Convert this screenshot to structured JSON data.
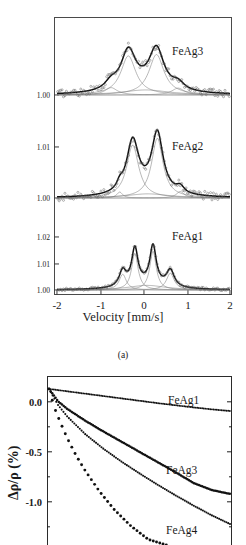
{
  "figure": {
    "subcaption_a": "(a)"
  },
  "mossbauer": {
    "ylabel": "Relative Emission",
    "xlabel": "Velocity [mm/s]",
    "xticks": [
      "-2",
      "-1",
      "0",
      "1",
      "2"
    ],
    "panels": [
      {
        "sample": "FeAg3",
        "yticks": [
          "1.00"
        ]
      },
      {
        "sample": "FeAg2",
        "yticks": [
          "1.01",
          "1.00"
        ]
      },
      {
        "sample": "FeAg1",
        "yticks": [
          "1.02",
          "1.01",
          "1.00"
        ]
      }
    ]
  },
  "magnetoresistance": {
    "ylabel": "Δρ/ρ (%)",
    "yticks": [
      "0.0",
      "-0.5",
      "-1.0"
    ],
    "curves": [
      "FeAg1",
      "FeAg3",
      "FeAg4"
    ]
  },
  "chart_data": [
    {
      "type": "line",
      "title": "Mossbauer spectra",
      "subcaption": "(a)",
      "xlabel": "Velocity [mm/s]",
      "ylabel": "Relative Emission",
      "xlim": [
        -2,
        2
      ],
      "xticks": [
        -2,
        -1,
        0,
        1,
        2
      ],
      "grid": false,
      "legend_position": "inside-right",
      "subplots": [
        {
          "name": "FeAg3",
          "ylim": [
            0.9985,
            1.0135
          ],
          "yticks": [
            1.0
          ],
          "ytick_labels": [
            "1.00"
          ],
          "baseline": 1.0,
          "markers": "open circles (experimental data)",
          "envelope": "thick black fitted curve",
          "components": [
            {
              "center": -0.35,
              "amplitude": 0.0085,
              "width": 0.42,
              "role": "main-doublet-left"
            },
            {
              "center": 0.3,
              "amplitude": 0.0088,
              "width": 0.42,
              "role": "main-doublet-right"
            },
            {
              "center": -0.75,
              "amplitude": 0.0016,
              "width": 0.35,
              "role": "minor-left"
            },
            {
              "center": 0.8,
              "amplitude": 0.0015,
              "width": 0.35,
              "role": "minor-right"
            },
            {
              "center": 0.05,
              "amplitude": 0.0011,
              "width": 1.3,
              "role": "broad-background"
            }
          ]
        },
        {
          "name": "FeAg2",
          "ylim": [
            0.9985,
            1.0185
          ],
          "yticks": [
            1.01,
            1.0
          ],
          "ytick_labels": [
            "1.01",
            "1.00"
          ],
          "baseline": 1.0,
          "markers": "open circles (experimental data)",
          "envelope": "thick black fitted curve",
          "components": [
            {
              "center": -0.25,
              "amplitude": 0.0115,
              "width": 0.34,
              "role": "main-doublet-left"
            },
            {
              "center": 0.32,
              "amplitude": 0.013,
              "width": 0.32,
              "role": "main-doublet-right"
            },
            {
              "center": -0.55,
              "amplitude": 0.0013,
              "width": 0.16,
              "role": "minor-left"
            },
            {
              "center": 0.85,
              "amplitude": 0.0014,
              "width": 0.22,
              "role": "minor-right"
            },
            {
              "center": 0.1,
              "amplitude": 0.0009,
              "width": 1.2,
              "role": "broad-background"
            }
          ]
        },
        {
          "name": "FeAg1",
          "ylim": [
            0.9985,
            1.0245
          ],
          "yticks": [
            1.02,
            1.01,
            1.0
          ],
          "ytick_labels": [
            "1.02",
            "1.01",
            "1.00"
          ],
          "baseline": 1.0,
          "markers": "open circles (experimental data)",
          "envelope": "thick black fitted curve",
          "components": [
            {
              "center": -0.2,
              "amplitude": 0.0175,
              "width": 0.18,
              "role": "sharp-left"
            },
            {
              "center": 0.22,
              "amplitude": 0.0185,
              "width": 0.18,
              "role": "sharp-right"
            },
            {
              "center": -0.48,
              "amplitude": 0.0075,
              "width": 0.2,
              "role": "shoulder-left"
            },
            {
              "center": 0.62,
              "amplitude": 0.008,
              "width": 0.22,
              "role": "shoulder-right"
            },
            {
              "center": 0.08,
              "amplitude": 0.0022,
              "width": 1.05,
              "role": "broad-background"
            }
          ]
        }
      ]
    },
    {
      "type": "scatter",
      "title": "Magnetoresistance",
      "xlabel": "",
      "ylabel": "Δρ/ρ (%)",
      "yticks": [
        0.0,
        -0.5,
        -1.0
      ],
      "ytick_labels": [
        "0.0",
        "-0.5",
        "-1.0"
      ],
      "ylim": [
        -1.45,
        0.12
      ],
      "xlim": [
        0,
        1
      ],
      "grid": false,
      "legend_position": "inline-right-of-curve",
      "series": [
        {
          "name": "FeAg1",
          "x": [
            0,
            0.1,
            0.2,
            0.3,
            0.4,
            0.5,
            0.6,
            0.7,
            0.8,
            0.9,
            1.0
          ],
          "values": [
            0.0,
            -0.022,
            -0.044,
            -0.066,
            -0.088,
            -0.11,
            -0.132,
            -0.152,
            -0.172,
            -0.19,
            -0.205
          ]
        },
        {
          "name": "FeAg3",
          "x": [
            0,
            0.05,
            0.1,
            0.2,
            0.3,
            0.4,
            0.5,
            0.6,
            0.7,
            0.8,
            0.9,
            1.0
          ],
          "values": [
            0.0,
            -0.115,
            -0.185,
            -0.295,
            -0.395,
            -0.49,
            -0.585,
            -0.68,
            -0.775,
            -0.875,
            -0.94,
            -0.975
          ]
        },
        {
          "name": "FeAg4",
          "x": [
            0,
            0.05,
            0.1,
            0.2,
            0.3,
            0.4,
            0.5,
            0.6,
            0.7,
            0.8,
            0.9,
            1.0
          ],
          "values": [
            0.0,
            -0.15,
            -0.255,
            -0.42,
            -0.555,
            -0.675,
            -0.785,
            -0.89,
            -0.99,
            -1.085,
            -1.175,
            -1.255
          ]
        },
        {
          "name": "unlabeled-steep-curve",
          "x": [
            0,
            0.03,
            0.06,
            0.1,
            0.15,
            0.2,
            0.28,
            0.36,
            0.45,
            0.55,
            0.65
          ],
          "values": [
            0.0,
            -0.175,
            -0.3,
            -0.455,
            -0.62,
            -0.76,
            -0.955,
            -1.12,
            -1.27,
            -1.4,
            -1.45
          ]
        }
      ]
    }
  ]
}
